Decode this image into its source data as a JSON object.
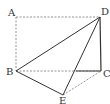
{
  "diagram": {
    "type": "geometry",
    "points": {
      "A": {
        "label": "A",
        "x": 16,
        "y": 17
      },
      "B": {
        "label": "B",
        "x": 16,
        "y": 71
      },
      "C": {
        "label": "C",
        "x": 101,
        "y": 71
      },
      "D": {
        "label": "D",
        "x": 100,
        "y": 17
      },
      "E": {
        "label": "E",
        "x": 63,
        "y": 95
      }
    },
    "solid_segments": [
      "BD",
      "DC",
      "BE",
      "ED"
    ],
    "dashed_segments": [
      "AD",
      "AB",
      "BC",
      "EC"
    ],
    "colors": {
      "line": "#333333",
      "dashed": "#777777"
    }
  }
}
